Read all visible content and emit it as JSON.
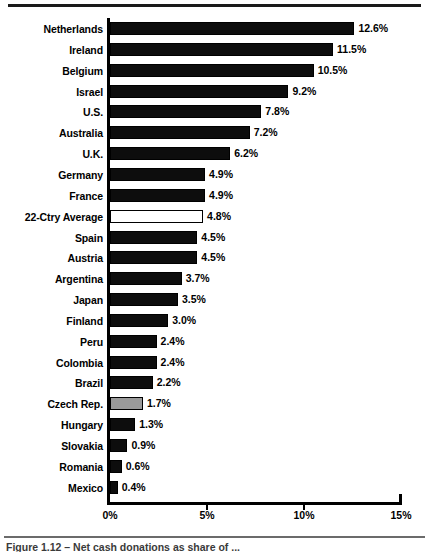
{
  "figure": {
    "caption": "Figure 1.12 – Net cash donations as share of ..."
  },
  "chart_data": {
    "type": "bar",
    "orientation": "horizontal",
    "title": "",
    "xlabel": "",
    "ylabel": "",
    "xlim": [
      0,
      15
    ],
    "xticks": [
      0,
      5,
      10,
      15
    ],
    "xtick_labels": [
      "0%",
      "5%",
      "10%",
      "15%"
    ],
    "grid": false,
    "legend": null,
    "value_suffix": "%",
    "categories": [
      "Netherlands",
      "Ireland",
      "Belgium",
      "Israel",
      "U.S.",
      "Australia",
      "U.K.",
      "Germany",
      "France",
      "22-Ctry Average",
      "Spain",
      "Austria",
      "Argentina",
      "Japan",
      "Finland",
      "Peru",
      "Colombia",
      "Brazil",
      "Czech Rep.",
      "Hungary",
      "Slovakia",
      "Romania",
      "Mexico"
    ],
    "values": [
      12.6,
      11.5,
      10.5,
      9.2,
      7.8,
      7.2,
      6.2,
      4.9,
      4.9,
      4.8,
      4.5,
      4.5,
      3.7,
      3.5,
      3.0,
      2.4,
      2.4,
      2.2,
      1.7,
      1.3,
      0.9,
      0.6,
      0.4
    ],
    "value_labels": [
      "12.6%",
      "11.5%",
      "10.5%",
      "9.2%",
      "7.8%",
      "7.2%",
      "6.2%",
      "4.9%",
      "4.9%",
      "4.8%",
      "4.5%",
      "4.5%",
      "3.7%",
      "3.5%",
      "3.0%",
      "2.4%",
      "2.4%",
      "2.2%",
      "1.7%",
      "1.3%",
      "0.9%",
      "0.6%",
      "0.4%"
    ],
    "bar_styles": [
      "filled",
      "filled",
      "filled",
      "filled",
      "filled",
      "filled",
      "filled",
      "filled",
      "filled",
      "outline",
      "filled",
      "filled",
      "filled",
      "filled",
      "filled",
      "filled",
      "filled",
      "filled",
      "gray",
      "filled",
      "filled",
      "filled",
      "filled"
    ],
    "colors": {
      "filled": "#0d0d0d",
      "outline": "#ffffff",
      "gray": "#9a9a9a",
      "axis": "#000000",
      "text": "#000000"
    }
  }
}
